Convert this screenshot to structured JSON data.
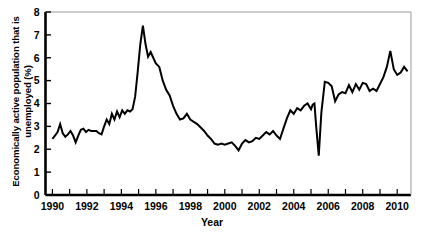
{
  "chart_data": {
    "type": "line",
    "title": "",
    "xlabel": "Year",
    "ylabel": "Economically active population that is unemployed (%)",
    "ylabel_line1": "Economically active population that is",
    "ylabel_line2": "unemployed (%)",
    "xlim": [
      1989.6,
      2010.8
    ],
    "ylim": [
      0,
      8
    ],
    "yticks": [
      0,
      1,
      2,
      3,
      4,
      5,
      6,
      7,
      8
    ],
    "ytick_labels": [
      "0",
      "1",
      "2",
      "3",
      "4",
      "5",
      "6",
      "7",
      "8"
    ],
    "xticks": [
      1990,
      1991,
      1992,
      1993,
      1994,
      1995,
      1996,
      1997,
      1998,
      1999,
      2000,
      2001,
      2002,
      2003,
      2004,
      2005,
      2006,
      2007,
      2008,
      2009,
      2010
    ],
    "xtick_labels_shown": [
      "1990",
      "1992",
      "1994",
      "1996",
      "1998",
      "2000",
      "2002",
      "2004",
      "2006",
      "2008",
      "2010"
    ],
    "grid": false,
    "legend": "none",
    "line_color": "#000000",
    "line_width": 2,
    "series": [
      {
        "name": "Unemployment rate",
        "x": [
          1990.0,
          1990.15,
          1990.3,
          1990.45,
          1990.6,
          1990.75,
          1990.9,
          1991.05,
          1991.2,
          1991.35,
          1991.5,
          1991.65,
          1991.8,
          1991.95,
          1992.1,
          1992.25,
          1992.4,
          1992.55,
          1992.7,
          1992.85,
          1993.0,
          1993.15,
          1993.3,
          1993.45,
          1993.6,
          1993.75,
          1993.9,
          1994.05,
          1994.2,
          1994.35,
          1994.5,
          1994.65,
          1994.8,
          1994.95,
          1995.1,
          1995.25,
          1995.4,
          1995.55,
          1995.7,
          1995.85,
          1996.0,
          1996.2,
          1996.4,
          1996.6,
          1996.8,
          1997.0,
          1997.2,
          1997.4,
          1997.6,
          1997.8,
          1998.0,
          1998.2,
          1998.4,
          1998.6,
          1998.8,
          1999.0,
          1999.2,
          1999.4,
          1999.6,
          1999.8,
          2000.0,
          2000.2,
          2000.4,
          2000.6,
          2000.8,
          2001.0,
          2001.2,
          2001.4,
          2001.6,
          2001.8,
          2002.0,
          2002.2,
          2002.4,
          2002.6,
          2002.8,
          2003.0,
          2003.2,
          2003.4,
          2003.6,
          2003.8,
          2004.0,
          2004.2,
          2004.4,
          2004.6,
          2004.8,
          2005.0,
          2005.1,
          2005.2,
          2005.3,
          2005.45,
          2005.6,
          2005.8,
          2006.0,
          2006.2,
          2006.4,
          2006.6,
          2006.8,
          2007.0,
          2007.2,
          2007.4,
          2007.6,
          2007.8,
          2008.0,
          2008.2,
          2008.4,
          2008.6,
          2008.8,
          2009.0,
          2009.2,
          2009.4,
          2009.6,
          2009.8,
          2010.0,
          2010.2,
          2010.4,
          2010.6
        ],
        "values": [
          2.45,
          2.6,
          2.75,
          3.1,
          2.7,
          2.55,
          2.65,
          2.8,
          2.6,
          2.3,
          2.6,
          2.85,
          2.9,
          2.75,
          2.85,
          2.8,
          2.8,
          2.8,
          2.7,
          2.65,
          3.0,
          3.3,
          3.1,
          3.55,
          3.3,
          3.65,
          3.4,
          3.7,
          3.55,
          3.7,
          3.65,
          3.75,
          4.3,
          5.4,
          6.6,
          7.4,
          6.6,
          6.05,
          6.25,
          6.0,
          5.75,
          5.6,
          5.0,
          4.6,
          4.35,
          3.9,
          3.55,
          3.3,
          3.35,
          3.55,
          3.3,
          3.2,
          3.1,
          2.95,
          2.8,
          2.6,
          2.45,
          2.25,
          2.2,
          2.25,
          2.2,
          2.25,
          2.3,
          2.15,
          1.95,
          2.25,
          2.4,
          2.3,
          2.35,
          2.5,
          2.45,
          2.6,
          2.75,
          2.65,
          2.8,
          2.6,
          2.45,
          2.9,
          3.35,
          3.7,
          3.55,
          3.8,
          3.7,
          3.9,
          4.0,
          3.75,
          3.95,
          4.0,
          3.0,
          1.72,
          3.6,
          4.95,
          4.9,
          4.75,
          4.1,
          4.4,
          4.5,
          4.45,
          4.8,
          4.5,
          4.85,
          4.6,
          4.9,
          4.85,
          4.55,
          4.65,
          4.55,
          4.85,
          5.15,
          5.6,
          6.3,
          5.5,
          5.25,
          5.35,
          5.6,
          5.4
        ]
      }
    ]
  },
  "axis": {
    "ylabel_text": "Economically active population that is unemployed (%)",
    "xtitle_text": "Year"
  }
}
